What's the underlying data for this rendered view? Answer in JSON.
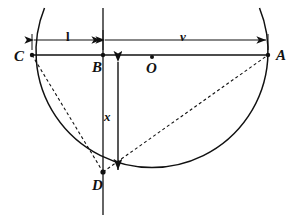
{
  "figure": {
    "type": "geometry-diagram",
    "background_color": "#ffffff",
    "stroke_color": "#111111",
    "points": [
      {
        "id": "C",
        "label": "C",
        "x": 32,
        "y": 55,
        "on": "circle"
      },
      {
        "id": "B",
        "label": "B",
        "x": 103,
        "y": 55,
        "on": "chord"
      },
      {
        "id": "O",
        "label": "O",
        "x": 152,
        "y": 57,
        "on": "center"
      },
      {
        "id": "A",
        "label": "A",
        "x": 268,
        "y": 55,
        "on": "circle"
      },
      {
        "id": "D",
        "label": "D",
        "x": 103,
        "y": 172,
        "on": "circle"
      }
    ],
    "circle": {
      "cx": 152,
      "cy": 57,
      "r": 116
    },
    "chord": {
      "from": "C",
      "to": "A",
      "y": 55
    },
    "vertical_line": {
      "x": 103,
      "from_y": 8,
      "to_y": 215
    },
    "dashed_segments": [
      {
        "from": "C",
        "to": "D"
      },
      {
        "from": "D",
        "to": "A"
      }
    ],
    "dimensions": [
      {
        "id": "l",
        "label": "l",
        "orientation": "horizontal",
        "y": 40,
        "from_x": 32,
        "to_x": 103,
        "between": "C-B"
      },
      {
        "id": "v",
        "label": "v",
        "orientation": "horizontal",
        "y": 40,
        "from_x": 103,
        "to_x": 268,
        "between": "B-A"
      },
      {
        "id": "x",
        "label": "x",
        "orientation": "vertical",
        "x": 118,
        "from_y": 60,
        "to_y": 172,
        "between": "B-D"
      }
    ]
  }
}
